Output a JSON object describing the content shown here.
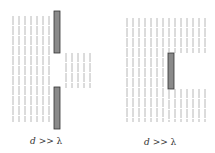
{
  "diagrams": [
    {
      "name": "slit",
      "caption_var": "d",
      "caption_rel": ">>",
      "caption_sym": "λ",
      "description": "Plane wavefronts passing through a wide slit"
    },
    {
      "name": "obstacle",
      "caption_var": "d",
      "caption_rel": ">>",
      "caption_sym": "λ",
      "description": "Plane wavefronts passing a wide obstacle"
    }
  ],
  "colors": {
    "wave": "#b8b8b8",
    "barrier_fill": "#8a8a8a",
    "barrier_stroke": "#333333"
  }
}
